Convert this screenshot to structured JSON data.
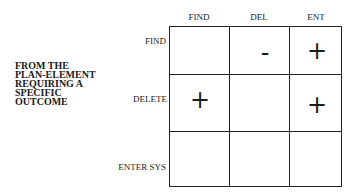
{
  "side_label": [
    "FROM THE",
    "PLAN-ELEMENT",
    "REQUIRING  A",
    "SPECIFIC",
    "OUTCOME"
  ],
  "columns": [
    "FIND",
    "DEL",
    "ENT"
  ],
  "rows": [
    "FIND",
    "DELETE",
    "ENTER SYS"
  ],
  "cells": [
    [
      "",
      "-",
      "+"
    ],
    [
      "+",
      "",
      "+"
    ],
    [
      "",
      "",
      ""
    ]
  ]
}
